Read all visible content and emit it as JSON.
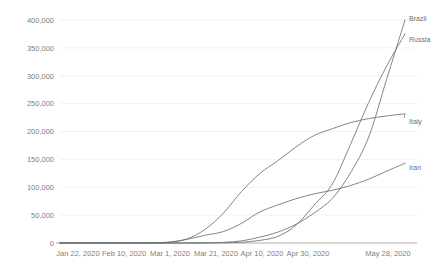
{
  "chart_data": {
    "type": "line",
    "title": "",
    "subtitle": "",
    "xlabel": "",
    "ylabel": "",
    "grid": true,
    "legend_position": "end-of-line-direct-labels",
    "ylim": [
      0,
      400000
    ],
    "ytick_labels": [
      "400,000",
      "350,000",
      "300,000",
      "250,000",
      "200,000",
      "150,000",
      "100,000",
      "50,000",
      "0"
    ],
    "ytick_values": [
      400000,
      350000,
      300000,
      250000,
      200000,
      150000,
      100000,
      50000,
      0
    ],
    "xtick_labels": [
      "Jan 22, 2020",
      "Feb 10, 2020",
      "Mar 1, 2020",
      "Mar 21, 2020",
      "Apr 10, 2020",
      "Apr 30, 2020",
      "May 28, 2020"
    ],
    "x": [
      "Jan 22, 2020",
      "Jan 29, 2020",
      "Feb 5, 2020",
      "Feb 10, 2020",
      "Feb 17, 2020",
      "Feb 24, 2020",
      "Mar 1, 2020",
      "Mar 8, 2020",
      "Mar 15, 2020",
      "Mar 21, 2020",
      "Mar 28, 2020",
      "Apr 4, 2020",
      "Apr 10, 2020",
      "Apr 17, 2020",
      "Apr 24, 2020",
      "Apr 30, 2020",
      "May 7, 2020",
      "May 14, 2020",
      "May 21, 2020",
      "May 28, 2020"
    ],
    "series": [
      {
        "name": "Brazil",
        "label": "Brazil",
        "color": "#6f6f6f",
        "values": [
          0,
          0,
          0,
          0,
          0,
          0,
          0,
          20,
          200,
          1100,
          3900,
          10400,
          19600,
          33700,
          54000,
          80000,
          126000,
          190000,
          295000,
          400000
        ]
      },
      {
        "name": "Russia",
        "label": "Russia",
        "color": "#6f6f6f",
        "values": [
          0,
          0,
          2,
          2,
          2,
          2,
          2,
          15,
          60,
          300,
          1300,
          4700,
          11900,
          32000,
          68000,
          106000,
          177000,
          252000,
          318000,
          375000
        ]
      },
      {
        "name": "Italy",
        "label": "Italy",
        "color": "#6f6f6f",
        "values": [
          0,
          0,
          2,
          3,
          3,
          230,
          1700,
          7400,
          24700,
          53600,
          92500,
          124600,
          147600,
          172400,
          192900,
          205000,
          215900,
          223100,
          228000,
          231700
        ]
      },
      {
        "name": "Iran",
        "label": "Iran",
        "color": "#6f6f6f",
        "values": [
          0,
          0,
          0,
          0,
          0,
          150,
          1000,
          6600,
          14000,
          20600,
          35400,
          55700,
          68200,
          79500,
          88200,
          94600,
          103100,
          114500,
          129000,
          143000
        ]
      }
    ]
  },
  "axes": {
    "plot_left": 60,
    "plot_right": 405,
    "plot_top": 20,
    "plot_bottom": 243
  }
}
